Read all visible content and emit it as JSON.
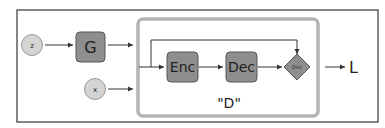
{
  "diagram": {
    "nodes": {
      "z": {
        "label": "z",
        "shape": "circle"
      },
      "x": {
        "label": "x",
        "shape": "circle"
      },
      "G": {
        "label": "G",
        "shape": "rounded-box"
      },
      "Enc": {
        "label": "Enc",
        "shape": "rounded-box"
      },
      "Dec": {
        "label": "Dec",
        "shape": "rounded-box"
      },
      "Dist": {
        "label": "Dist",
        "shape": "diamond"
      },
      "L": {
        "label": "L",
        "shape": "text"
      }
    },
    "group": {
      "label": "\"D\""
    },
    "edges": [
      {
        "from": "z",
        "to": "G"
      },
      {
        "from": "G",
        "to": "D"
      },
      {
        "from": "x",
        "to": "D"
      },
      {
        "from": "D-input",
        "to": "Enc"
      },
      {
        "from": "Enc",
        "to": "Dec"
      },
      {
        "from": "Dec",
        "to": "Dist"
      },
      {
        "from": "D-input",
        "to": "Dist",
        "route": "skip-over-top"
      },
      {
        "from": "Dist",
        "to": "L"
      }
    ],
    "colors": {
      "node_fill": "#8e8e8e",
      "circle_fill": "#d4d4d4",
      "group_border": "#b4b4b4",
      "outline": "#555555"
    }
  }
}
